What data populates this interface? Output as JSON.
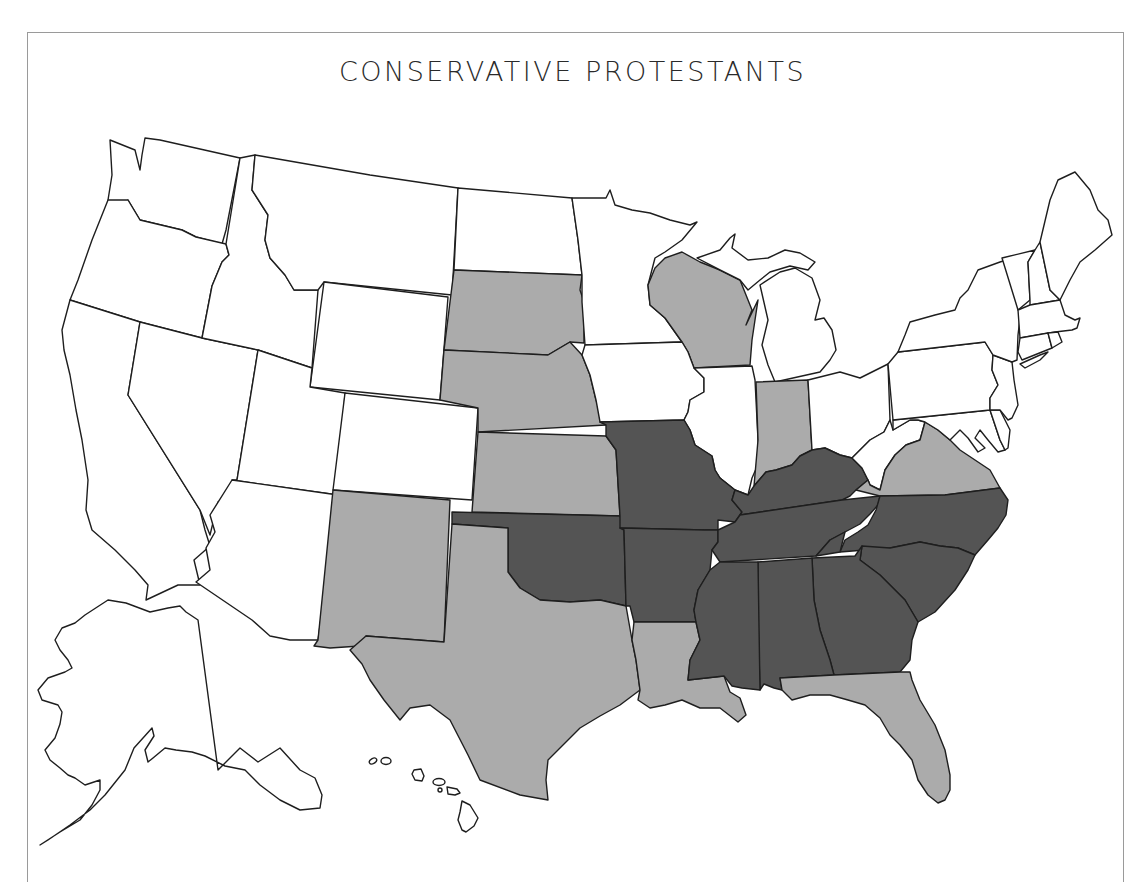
{
  "map": {
    "title": "CONSERVATIVE PROTESTANTS",
    "fill_legend": {
      "none": "#ffffff",
      "moderate": "#ababab",
      "high": "#545454"
    },
    "states": {
      "high": [
        "Missouri",
        "Oklahoma",
        "Arkansas",
        "Kentucky",
        "Tennessee",
        "Mississippi",
        "Alabama",
        "Georgia",
        "South Carolina",
        "North Carolina"
      ],
      "moderate": [
        "South Dakota",
        "Nebraska",
        "Kansas",
        "New Mexico",
        "Texas",
        "Louisiana",
        "Florida",
        "Wisconsin",
        "Indiana",
        "Virginia"
      ],
      "none": [
        "Washington",
        "Oregon",
        "California",
        "Nevada",
        "Idaho",
        "Montana",
        "Wyoming",
        "Utah",
        "Colorado",
        "Arizona",
        "North Dakota",
        "Minnesota",
        "Iowa",
        "Illinois",
        "Michigan",
        "Ohio",
        "West Virginia",
        "Pennsylvania",
        "New York",
        "Vermont",
        "New Hampshire",
        "Maine",
        "Massachusetts",
        "Connecticut",
        "Rhode Island",
        "New Jersey",
        "Delaware",
        "Maryland",
        "Alaska",
        "Hawaii"
      ]
    }
  }
}
